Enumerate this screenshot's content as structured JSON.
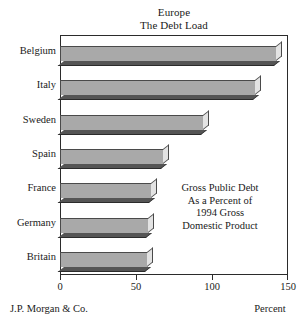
{
  "chart_data": {
    "type": "bar",
    "orientation": "horizontal",
    "title": "Europe",
    "subtitle": "The Debt Load",
    "categories": [
      "Belgium",
      "Italy",
      "Sweden",
      "Spain",
      "France",
      "Germany",
      "Britain"
    ],
    "values": [
      142,
      128,
      94,
      68,
      60,
      58,
      57
    ],
    "xlabel": "Percent",
    "ylabel": "",
    "xlim": [
      0,
      150
    ],
    "xticks": [
      0,
      50,
      100,
      150
    ],
    "xtick_labels": [
      "0",
      "50",
      "100",
      "150"
    ],
    "grid": false,
    "legend": null,
    "annotation": [
      "Gross Public Debt",
      "As a Percent of",
      "1994 Gross",
      "Domestic Product"
    ],
    "source": "J.P. Morgan & Co.",
    "colors": {
      "bar_face": "#a9a9a9",
      "bar_top_cap": "#e3e3e3",
      "bar_shadow": "#555555",
      "outline": "#2b2b2b",
      "background": "#ffffff",
      "text": "#1a1a1a"
    }
  }
}
